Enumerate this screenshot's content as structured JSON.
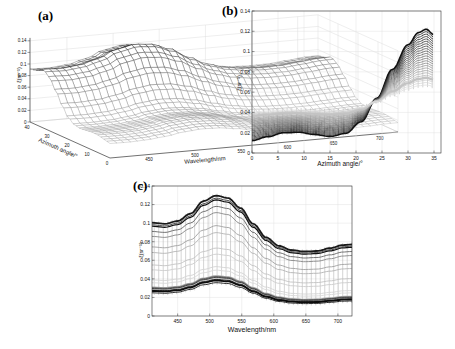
{
  "figure": {
    "background": "#ffffff"
  },
  "panels": {
    "a": {
      "label": "(a)",
      "xlabel": "Wavelength/nm",
      "ylabel": "Azimuth angle/°",
      "zlabel": "ξ(sr⁻¹)"
    },
    "b": {
      "label": "(b)",
      "xlabel": "Azimuth angle/°",
      "ylabel": "ξ(sr⁻¹)"
    },
    "c": {
      "label": "(c)",
      "xlabel": "Wavelength/nm",
      "ylabel": "ξ(sr⁻¹)"
    }
  },
  "chart_data": [
    {
      "type": "surface3d-mesh",
      "title": "(a)",
      "xlabel": "Wavelength/nm",
      "ylabel": "Azimuth angle/°",
      "zlabel": "ξ(sr⁻¹)",
      "wavelength_range": [
        410,
        722
      ],
      "azimuth_range": [
        0,
        40
      ],
      "z_range": [
        0,
        0.14
      ],
      "z_ticks": [
        0,
        0.02,
        0.04,
        0.06,
        0.08,
        0.1,
        0.12,
        0.14
      ],
      "z_tick_labels": [
        "0",
        "0.02",
        "0.04",
        "0.06",
        "0.08",
        "0.1",
        "0.12",
        "0.14"
      ],
      "azimuth_ticks": [
        0,
        10,
        20,
        30,
        40
      ],
      "wavelength_ticks": [
        450,
        500,
        550,
        600,
        650,
        700
      ],
      "grid": true,
      "surface_model": {
        "description": "z(az,wl) = base(r) + amp(r)*s(wl), r = azimuth rise profile, s = spectral shape, both 0..1",
        "base": {
          "c0": 0.012,
          "c1": 0.0568
        },
        "amp": {
          "c0": 0.022,
          "c1": 0.0389
        },
        "peak_value": 0.13,
        "peak_at": {
          "azimuth": 33,
          "wavelength": 510
        }
      }
    },
    {
      "type": "line-family",
      "title": "(b)",
      "xlabel": "Azimuth angle/°",
      "ylabel": "ξ(sr⁻¹)",
      "x_range": [
        0,
        35
      ],
      "y_range": [
        0,
        0.14
      ],
      "x_ticks": [
        0,
        5,
        10,
        15,
        20,
        25,
        30,
        35
      ],
      "x_tick_labels": [
        "0",
        "5",
        "10",
        "15",
        "20",
        "25",
        "30",
        "35"
      ],
      "y_ticks": [
        0,
        0.02,
        0.04,
        0.06,
        0.08,
        0.1,
        0.12,
        0.14
      ],
      "y_tick_labels": [
        "0",
        "0.02",
        "0.04",
        "0.06",
        "0.08",
        "0.1",
        "0.12",
        "0.14"
      ],
      "grid": true,
      "n_curves": 24,
      "curve_model": "v_i(az) = start_i + (peak_i - start_i) * rise(az); flat plateau to az~15, steep rise to max near az=33, slight drop at 35",
      "start_values": [
        0.01,
        0.0113,
        0.0126,
        0.0139,
        0.0152,
        0.0165,
        0.0178,
        0.0191,
        0.0204,
        0.0217,
        0.023,
        0.0243,
        0.0256,
        0.0269,
        0.0282,
        0.0295,
        0.0308,
        0.0321,
        0.0334,
        0.0347,
        0.036,
        0.0373,
        0.0386,
        0.0399
      ],
      "peak_values": [
        0.122,
        0.1196,
        0.1172,
        0.1148,
        0.1124,
        0.1101,
        0.1077,
        0.1053,
        0.1029,
        0.1005,
        0.0981,
        0.0957,
        0.0933,
        0.0909,
        0.0885,
        0.0862,
        0.0838,
        0.0814,
        0.079,
        0.0766,
        0.0742,
        0.0718,
        0.0694,
        0.067
      ],
      "gray_levels": [
        15,
        24,
        33,
        42,
        51,
        60,
        69,
        78,
        87,
        96,
        105,
        114,
        123,
        132,
        141,
        150,
        159,
        168,
        177,
        186,
        195,
        204,
        213,
        222
      ],
      "thick_curves": {
        "0": 1.6,
        "20": 2.4
      }
    },
    {
      "type": "line-family",
      "title": "(c)",
      "xlabel": "Wavelength/nm",
      "ylabel": "ξ(sr⁻¹)",
      "x_range": [
        410,
        722
      ],
      "y_range": [
        0,
        0.14
      ],
      "x_ticks": [
        450,
        500,
        550,
        600,
        650,
        700
      ],
      "x_tick_labels": [
        "450",
        "500",
        "550",
        "600",
        "650",
        "700"
      ],
      "y_ticks": [
        0,
        0.02,
        0.04,
        0.06,
        0.08,
        0.1,
        0.12,
        0.14
      ],
      "y_tick_labels": [
        "0",
        "0.02",
        "0.04",
        "0.06",
        "0.08",
        "0.1",
        "0.12",
        "0.14"
      ],
      "grid": true,
      "n_curves": 24,
      "curve_model": "one spectral curve per azimuth 35..0 deg: v_j(wl) = g_j + h_j*s(wl); peak near 510 nm, dip near 630 nm, small rise past 700 nm",
      "base": {
        "c0": 0.012,
        "c1": 0.0568
      },
      "amp": {
        "c0": 0.022,
        "c1": 0.0389
      },
      "azimuths": [
        35,
        33.5,
        32,
        30.5,
        29,
        27.5,
        26,
        24.5,
        23,
        21.5,
        20,
        18.5,
        17,
        15.5,
        14,
        12.5,
        11,
        9.5,
        8,
        6.5,
        5,
        3.5,
        2,
        0
      ],
      "gray_levels": [
        15,
        25,
        60,
        100,
        135,
        160,
        180,
        195,
        205,
        212,
        216,
        218,
        216,
        210,
        200,
        188,
        196,
        175,
        140,
        95,
        60,
        30,
        12,
        22
      ],
      "thick_curves": {
        "0": 1.2,
        "1": 1.8,
        "17": 2.3,
        "22": 1.8
      }
    }
  ],
  "shape_functions": {
    "spectral_s_points": [
      [
        410,
        0.52
      ],
      [
        430,
        0.5
      ],
      [
        450,
        0.55
      ],
      [
        470,
        0.68
      ],
      [
        490,
        0.9
      ],
      [
        510,
        1.0
      ],
      [
        528,
        0.96
      ],
      [
        548,
        0.78
      ],
      [
        568,
        0.5
      ],
      [
        588,
        0.26
      ],
      [
        608,
        0.11
      ],
      [
        628,
        0.035
      ],
      [
        648,
        0.01
      ],
      [
        668,
        0.02
      ],
      [
        688,
        0.07
      ],
      [
        708,
        0.125
      ],
      [
        722,
        0.135
      ]
    ],
    "azimuth_rise_points": [
      [
        0,
        0.02
      ],
      [
        3,
        0.055
      ],
      [
        6,
        0.09
      ],
      [
        9,
        0.095
      ],
      [
        12,
        0.075
      ],
      [
        15,
        0.058
      ],
      [
        18,
        0.085
      ],
      [
        21,
        0.19
      ],
      [
        24,
        0.4
      ],
      [
        27,
        0.66
      ],
      [
        30,
        0.88
      ],
      [
        32,
        0.99
      ],
      [
        33.5,
        1.02
      ],
      [
        35,
        0.97
      ],
      [
        37,
        0.93
      ],
      [
        40,
        0.9
      ]
    ],
    "rise_norm": 1.02
  }
}
